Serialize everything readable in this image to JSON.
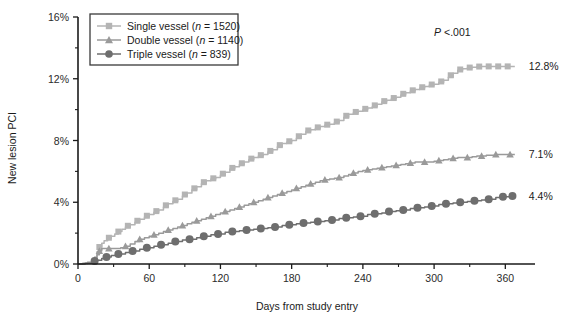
{
  "chart_data": {
    "type": "line",
    "title": "",
    "xlabel": "Days from study entry",
    "ylabel": "New lesion PCI",
    "xlim": [
      0,
      385
    ],
    "ylim": [
      0,
      16
    ],
    "xticks": [
      0,
      60,
      120,
      180,
      240,
      300,
      360
    ],
    "xtick_labels": [
      "0",
      "60",
      "120",
      "180",
      "240",
      "300",
      "360"
    ],
    "xminor_ticks": [
      30,
      90,
      150,
      210,
      270,
      330
    ],
    "yticks": [
      0,
      4,
      8,
      12,
      16
    ],
    "ytick_labels": [
      "0%",
      "4%",
      "8%",
      "12%",
      "16%"
    ],
    "yminor_ticks": [
      2,
      6,
      10,
      14
    ],
    "grid": false,
    "legend_position": "top-left",
    "annotations": [
      {
        "name": "p-value",
        "text": "P <.001",
        "italic_prefix": "P",
        "rest": " <.001",
        "x": 300,
        "y": 15.0
      },
      {
        "name": "end-label-single",
        "text": "12.8%",
        "x": 368,
        "y": 12.8
      },
      {
        "name": "end-label-double",
        "text": "7.1%",
        "x": 368,
        "y": 7.1
      },
      {
        "name": "end-label-triple",
        "text": "4.4%",
        "x": 368,
        "y": 4.4
      }
    ],
    "series": [
      {
        "name": "Single vessel",
        "legend_label": "Single vessel (n = 1520)",
        "n": 1520,
        "color": "#b4b4b4",
        "marker": "square",
        "final_value": 12.8,
        "x": [
          0,
          4,
          8,
          12,
          14,
          16,
          18,
          20,
          22,
          25,
          28,
          31,
          34,
          37,
          40,
          44,
          48,
          52,
          56,
          60,
          64,
          68,
          72,
          76,
          80,
          84,
          88,
          92,
          96,
          100,
          104,
          108,
          112,
          116,
          120,
          124,
          128,
          132,
          136,
          140,
          144,
          148,
          152,
          156,
          160,
          164,
          168,
          172,
          176,
          180,
          184,
          188,
          192,
          196,
          200,
          204,
          208,
          212,
          216,
          220,
          224,
          228,
          232,
          236,
          240,
          244,
          248,
          252,
          256,
          260,
          264,
          268,
          272,
          276,
          280,
          284,
          288,
          292,
          296,
          300,
          304,
          308,
          312,
          316,
          320,
          324,
          328,
          332,
          336,
          340,
          344,
          348,
          352,
          356,
          360,
          364,
          368
        ],
        "y": [
          0,
          0.05,
          0.12,
          0.25,
          0.45,
          0.8,
          1.1,
          1.35,
          1.5,
          1.65,
          1.8,
          1.95,
          2.1,
          2.25,
          2.4,
          2.55,
          2.7,
          2.9,
          3.05,
          3.2,
          3.35,
          3.5,
          3.7,
          3.9,
          4.05,
          4.2,
          4.4,
          4.6,
          4.8,
          5.0,
          5.2,
          5.4,
          5.5,
          5.6,
          5.75,
          5.95,
          6.15,
          6.3,
          6.45,
          6.6,
          6.75,
          6.9,
          7.0,
          7.1,
          7.25,
          7.4,
          7.6,
          7.8,
          7.9,
          8.0,
          8.15,
          8.4,
          8.6,
          8.7,
          8.8,
          8.9,
          9.0,
          9.05,
          9.15,
          9.3,
          9.5,
          9.7,
          9.8,
          9.9,
          10.0,
          10.1,
          10.2,
          10.35,
          10.5,
          10.6,
          10.7,
          10.8,
          10.95,
          11.1,
          11.2,
          11.3,
          11.4,
          11.5,
          11.6,
          11.65,
          11.75,
          11.9,
          12.1,
          12.35,
          12.55,
          12.65,
          12.7,
          12.75,
          12.78,
          12.8,
          12.8,
          12.8,
          12.8,
          12.8,
          12.8,
          12.8,
          12.8
        ]
      },
      {
        "name": "Double vessel",
        "legend_label": "Double vessel (n = 1140)",
        "n": 1140,
        "color": "#9a9a9a",
        "marker": "triangle",
        "final_value": 7.1,
        "x": [
          0,
          4,
          8,
          12,
          14,
          16,
          18,
          20,
          24,
          28,
          32,
          36,
          40,
          44,
          48,
          52,
          56,
          60,
          64,
          68,
          72,
          76,
          80,
          84,
          88,
          92,
          96,
          100,
          104,
          108,
          112,
          116,
          120,
          124,
          128,
          132,
          136,
          140,
          144,
          148,
          152,
          156,
          160,
          164,
          168,
          172,
          176,
          180,
          184,
          188,
          192,
          196,
          200,
          204,
          208,
          212,
          216,
          220,
          224,
          228,
          232,
          236,
          240,
          244,
          248,
          252,
          256,
          260,
          264,
          268,
          272,
          276,
          280,
          284,
          288,
          292,
          296,
          300,
          304,
          308,
          312,
          316,
          320,
          324,
          328,
          332,
          336,
          340,
          344,
          348,
          352,
          356,
          360,
          364,
          368
        ],
        "y": [
          0,
          0.04,
          0.1,
          0.2,
          0.35,
          0.6,
          0.85,
          1.0,
          1.0,
          1.0,
          1.0,
          1.05,
          1.15,
          1.3,
          1.45,
          1.6,
          1.7,
          1.8,
          1.9,
          2.0,
          2.1,
          2.2,
          2.3,
          2.4,
          2.5,
          2.6,
          2.7,
          2.8,
          2.9,
          3.0,
          3.1,
          3.2,
          3.3,
          3.4,
          3.5,
          3.6,
          3.7,
          3.8,
          3.9,
          4.0,
          4.1,
          4.2,
          4.3,
          4.4,
          4.5,
          4.6,
          4.7,
          4.8,
          4.9,
          5.0,
          5.1,
          5.2,
          5.3,
          5.4,
          5.45,
          5.5,
          5.55,
          5.6,
          5.7,
          5.8,
          5.9,
          6.0,
          6.05,
          6.1,
          6.15,
          6.2,
          6.25,
          6.3,
          6.35,
          6.4,
          6.45,
          6.5,
          6.55,
          6.6,
          6.6,
          6.6,
          6.6,
          6.65,
          6.7,
          6.75,
          6.8,
          6.85,
          6.9,
          6.9,
          6.9,
          6.95,
          7.0,
          7.0,
          7.05,
          7.05,
          7.1,
          7.1,
          7.1,
          7.1,
          7.1
        ]
      },
      {
        "name": "Triple vessel",
        "legend_label": "Triple vessel (n = 839)",
        "n": 839,
        "color": "#6e6e6e",
        "marker": "circle",
        "final_value": 4.4,
        "x": [
          0,
          6,
          12,
          16,
          20,
          24,
          28,
          34,
          40,
          46,
          52,
          58,
          64,
          70,
          76,
          82,
          88,
          94,
          100,
          106,
          112,
          118,
          124,
          130,
          136,
          142,
          148,
          154,
          160,
          166,
          172,
          178,
          184,
          190,
          196,
          202,
          208,
          214,
          220,
          226,
          232,
          238,
          244,
          250,
          256,
          262,
          268,
          274,
          280,
          286,
          292,
          298,
          304,
          310,
          316,
          322,
          328,
          334,
          340,
          346,
          352,
          358,
          364,
          368
        ],
        "y": [
          0,
          0.05,
          0.15,
          0.25,
          0.35,
          0.45,
          0.55,
          0.65,
          0.75,
          0.85,
          0.95,
          1.05,
          1.15,
          1.25,
          1.35,
          1.45,
          1.55,
          1.6,
          1.7,
          1.8,
          1.9,
          1.95,
          2.05,
          2.1,
          2.15,
          2.2,
          2.25,
          2.3,
          2.35,
          2.4,
          2.5,
          2.55,
          2.6,
          2.65,
          2.7,
          2.75,
          2.8,
          2.85,
          2.95,
          3.0,
          3.05,
          3.1,
          3.2,
          3.25,
          3.3,
          3.4,
          3.45,
          3.5,
          3.6,
          3.65,
          3.7,
          3.75,
          3.85,
          3.9,
          3.95,
          4.0,
          4.05,
          4.1,
          4.15,
          4.2,
          4.3,
          4.35,
          4.4,
          4.4
        ]
      }
    ],
    "marker_x_single": [
      18,
      26,
      34,
      42,
      50,
      58,
      66,
      74,
      82,
      90,
      98,
      106,
      114,
      122,
      130,
      138,
      146,
      154,
      162,
      170,
      178,
      186,
      194,
      202,
      210,
      218,
      226,
      234,
      242,
      250,
      258,
      266,
      274,
      282,
      290,
      298,
      306,
      314,
      322,
      330,
      338,
      346,
      354,
      362
    ],
    "marker_x_double": [
      18,
      26,
      40,
      52,
      64,
      76,
      88,
      100,
      112,
      124,
      136,
      148,
      160,
      172,
      184,
      196,
      208,
      220,
      232,
      244,
      256,
      268,
      280,
      292,
      304,
      316,
      328,
      340,
      352,
      364
    ],
    "marker_x_triple": [
      14,
      24,
      34,
      46,
      58,
      70,
      82,
      94,
      106,
      118,
      130,
      142,
      154,
      166,
      178,
      190,
      202,
      214,
      226,
      238,
      250,
      262,
      274,
      286,
      298,
      310,
      322,
      334,
      346,
      358,
      366
    ]
  },
  "legend": {
    "items": [
      {
        "label_prefix": "Single vessel (",
        "italic": "n",
        "label_suffix": " = 1520)",
        "marker": "square",
        "color": "#b4b4b4"
      },
      {
        "label_prefix": "Double vessel (",
        "italic": "n",
        "label_suffix": " = 1140)",
        "marker": "triangle",
        "color": "#9a9a9a"
      },
      {
        "label_prefix": "Triple vessel (",
        "italic": "n",
        "label_suffix": " = 839)",
        "marker": "circle",
        "color": "#6e6e6e"
      }
    ]
  }
}
